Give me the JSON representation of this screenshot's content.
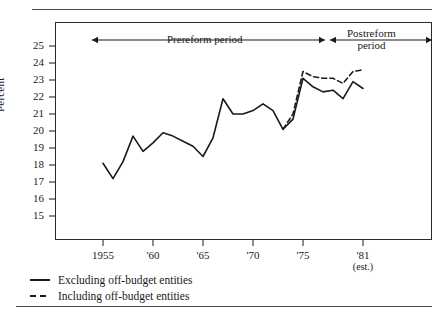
{
  "chart_data": {
    "type": "line",
    "title": "",
    "xlabel": "",
    "ylabel": "Percent",
    "xlim": [
      1954,
      1982
    ],
    "ylim": [
      14.3,
      25.8
    ],
    "grid": false,
    "legend_position": "below-left",
    "y_ticks": [
      25,
      24,
      23,
      22,
      21,
      20,
      19,
      18,
      17,
      16,
      15
    ],
    "x_ticks": [
      {
        "value": 1955,
        "label": "1955",
        "sublabel": ""
      },
      {
        "value": 1960,
        "label": "'60",
        "sublabel": ""
      },
      {
        "value": 1965,
        "label": "'65",
        "sublabel": ""
      },
      {
        "value": 1970,
        "label": "'70",
        "sublabel": ""
      },
      {
        "value": 1975,
        "label": "'75",
        "sublabel": ""
      },
      {
        "value": 1981,
        "label": "'81",
        "sublabel": "(est.)"
      }
    ],
    "x": [
      1955,
      1956,
      1957,
      1958,
      1959,
      1960,
      1961,
      1962,
      1963,
      1964,
      1965,
      1966,
      1967,
      1968,
      1969,
      1970,
      1971,
      1972,
      1973,
      1974,
      1975,
      1976,
      1977,
      1978,
      1979,
      1980,
      1981
    ],
    "series": [
      {
        "name": "Excluding off-budget entities",
        "style": "solid",
        "color": "#1a1a1a",
        "values": [
          18.1,
          17.2,
          18.2,
          19.7,
          18.8,
          19.3,
          19.9,
          19.7,
          19.4,
          19.1,
          18.5,
          19.6,
          21.9,
          21.0,
          21.0,
          21.2,
          21.6,
          21.2,
          20.1,
          20.7,
          23.1,
          22.6,
          22.3,
          22.4,
          21.9,
          22.9,
          22.5
        ]
      },
      {
        "name": "Including off-budget entities",
        "style": "dashed",
        "color": "#1a1a1a",
        "x_start": 1973,
        "values": [
          null,
          null,
          null,
          null,
          null,
          null,
          null,
          null,
          null,
          null,
          null,
          null,
          null,
          null,
          null,
          null,
          null,
          null,
          20.1,
          21.0,
          23.5,
          23.2,
          23.1,
          23.1,
          22.8,
          23.5,
          23.6
        ]
      }
    ],
    "annotations": [
      {
        "name": "prereform-period",
        "text": "Prereform period",
        "x_start": 1955,
        "x_end": 1973.5,
        "arrows": "both"
      },
      {
        "name": "postreform-period",
        "text": "Postreform period",
        "x_start": 1973.5,
        "x_end": 1982,
        "arrows": "both"
      }
    ]
  },
  "axes": {
    "y_label": "Percent",
    "y_tick_labels": [
      "25",
      "24",
      "23",
      "22",
      "21",
      "20",
      "19",
      "18",
      "17",
      "16",
      "15"
    ],
    "x_tick_labels": [
      "1955",
      "'60",
      "'65",
      "'70",
      "'75",
      "'81"
    ],
    "x_tick_sublabels": [
      "",
      "",
      "",
      "",
      "",
      "(est.)"
    ]
  },
  "annotations": {
    "prereform": "Prereform period",
    "postreform_line1": "Postreform",
    "postreform_line2": "period"
  },
  "legend": {
    "items": [
      {
        "label": "Excluding off-budget entities",
        "style": "solid"
      },
      {
        "label": "Including off-budget entities",
        "style": "dashed"
      }
    ]
  }
}
